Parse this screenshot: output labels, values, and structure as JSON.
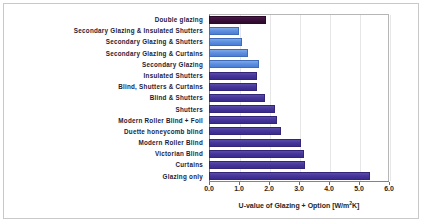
{
  "chart_data": {
    "type": "bar",
    "orientation": "horizontal",
    "title": "",
    "xlabel": "U-value of Glazing + Option [W/m²K]",
    "ylabel": "",
    "xlim": [
      0.0,
      6.0
    ],
    "xticks": [
      "0.0",
      "1.0",
      "2.0",
      "3.0",
      "4.0",
      "5.0",
      "6.0"
    ],
    "grid": false,
    "legend": "none",
    "categories": [
      "Double glazing",
      "Secondary Glazing & Insulated Shutters",
      "Secondary Glazing & Shutters",
      "Secondary Glazing & Curtains",
      "Secondary Glazing",
      "Insulated Shutters",
      "Blind, Shutters & Curtains",
      "Blind & Shutters",
      "Shutters",
      "Modern Roller Blind + Foil",
      "Duette honeycomb blind",
      "Modern Roller Blind",
      "Victorian Blind",
      "Curtains",
      "Glazing only"
    ],
    "values": [
      1.9,
      1.0,
      1.1,
      1.3,
      1.65,
      1.6,
      1.6,
      1.85,
      2.2,
      2.25,
      2.4,
      3.05,
      3.15,
      3.2,
      5.35
    ],
    "colors": [
      "#2c0b2b",
      "#5d8ede",
      "#5d8ede",
      "#5d8ede",
      "#5d8ede",
      "#46359a",
      "#46359a",
      "#46359a",
      "#46359a",
      "#46359a",
      "#46359a",
      "#46359a",
      "#46359a",
      "#46359a",
      "#46359a"
    ],
    "color_classes": [
      "c-dark",
      "c-blue",
      "c-blue",
      "c-blue",
      "c-blue",
      "c-purple",
      "c-purple",
      "c-purple",
      "c-purple",
      "c-purple",
      "c-purple",
      "c-purple",
      "c-purple",
      "c-purple",
      "c-purple"
    ]
  },
  "axis": {
    "x_title": "U-value of Glazing + Option [W/m",
    "x_title_sup": "2",
    "x_title_end": "K]"
  }
}
